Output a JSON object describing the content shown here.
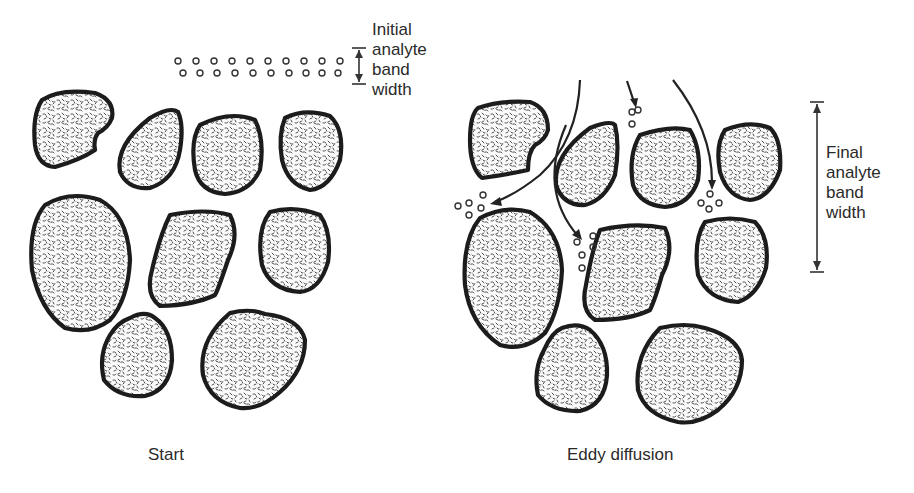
{
  "diagram": {
    "panels": [
      {
        "id": "start",
        "caption": "Start",
        "annotation": {
          "lines": [
            "Initial",
            "analyte",
            "band",
            "width"
          ]
        },
        "particle_count": 9,
        "analyte_band_rows": [
          10,
          10
        ]
      },
      {
        "id": "eddy",
        "caption": "Eddy diffusion",
        "annotation": {
          "lines": [
            "Final",
            "analyte",
            "band",
            "width"
          ]
        },
        "particle_count": 9,
        "flow_arrows": 4,
        "analyte_clusters": 5
      }
    ],
    "colors": {
      "outline": "#1c1c1c",
      "text": "#2a2a2a",
      "background": "#ffffff"
    }
  }
}
